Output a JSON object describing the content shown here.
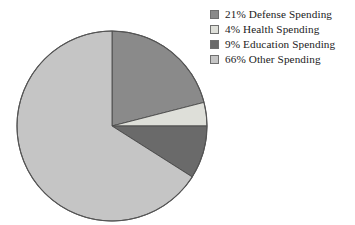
{
  "chart_data": {
    "type": "pie",
    "title": "",
    "subtitle": "",
    "xlabel": "",
    "ylabel": "",
    "legend_position": "top-right",
    "grid": false,
    "start_angle_deg": 0,
    "direction": "clockwise",
    "units": "percent",
    "categories": [
      "Defense Spending",
      "Health Spending",
      "Education Spending",
      "Other Spending"
    ],
    "values": [
      21,
      4,
      9,
      66
    ],
    "value_labels": [
      "21%",
      "4%",
      "9%",
      "66%"
    ],
    "colors": [
      "#8a8a8a",
      "#dedfd9",
      "#6a6a6a",
      "#c5c5c5"
    ],
    "slices": [
      {
        "label": "Defense Spending",
        "value": 21,
        "value_label": "21%",
        "legend_text": "21% Defense Spending",
        "color": "#8a8a8a",
        "start_deg": 0,
        "end_deg": 75.6
      },
      {
        "label": "Health Spending",
        "value": 4,
        "value_label": "4%",
        "legend_text": "4% Health Spending",
        "color": "#dedfd9",
        "start_deg": 75.6,
        "end_deg": 90.0
      },
      {
        "label": "Education Spending",
        "value": 9,
        "value_label": "9%",
        "legend_text": "9% Education Spending",
        "color": "#6a6a6a",
        "start_deg": 90.0,
        "end_deg": 122.4
      },
      {
        "label": "Other Spending",
        "value": 66,
        "value_label": "66%",
        "legend_text": "66% Other Spending",
        "color": "#c5c5c5",
        "start_deg": 122.4,
        "end_deg": 360.0
      }
    ]
  },
  "legend": {
    "items": [
      {
        "text": "21% Defense Spending",
        "color": "#8a8a8a"
      },
      {
        "text": "4% Health Spending",
        "color": "#dedfd9"
      },
      {
        "text": "9% Education Spending",
        "color": "#6a6a6a"
      },
      {
        "text": "66% Other Spending",
        "color": "#c5c5c5"
      }
    ]
  }
}
